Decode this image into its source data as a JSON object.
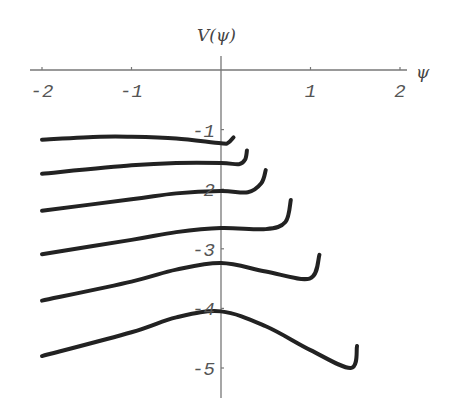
{
  "chart_data": {
    "type": "line",
    "title": "",
    "xlabel": "ψ",
    "ylabel": "V(ψ)",
    "xlim": [
      -2.05,
      2.1
    ],
    "ylim": [
      -5.5,
      0.25
    ],
    "grid": false,
    "legend": null,
    "x_ticks": [
      {
        "value": -2,
        "label": "-2"
      },
      {
        "value": -1,
        "label": "-1"
      },
      {
        "value": 1,
        "label": "1"
      },
      {
        "value": 2,
        "label": "2"
      }
    ],
    "y_ticks": [
      {
        "value": -1,
        "label": "-1"
      },
      {
        "value": -2,
        "label": "2"
      },
      {
        "value": -3,
        "label": "-3"
      },
      {
        "value": -4,
        "label": "-4"
      },
      {
        "value": -5,
        "label": "-5"
      }
    ],
    "series": [
      {
        "name": "curve-1",
        "points": [
          [
            -2,
            -1.17
          ],
          [
            -1.35,
            -1.12
          ],
          [
            -1,
            -1.12
          ],
          [
            -0.5,
            -1.15
          ],
          [
            0,
            -1.23
          ],
          [
            0.08,
            -1.22
          ],
          [
            0.14,
            -1.13
          ]
        ]
      },
      {
        "name": "curve-2",
        "points": [
          [
            -2,
            -1.74
          ],
          [
            -1,
            -1.6
          ],
          [
            -0.5,
            -1.56
          ],
          [
            0,
            -1.56
          ],
          [
            0.2,
            -1.58
          ],
          [
            0.27,
            -1.5
          ],
          [
            0.29,
            -1.35
          ]
        ]
      },
      {
        "name": "curve-3",
        "points": [
          [
            -2,
            -2.36
          ],
          [
            -1,
            -2.17
          ],
          [
            -0.5,
            -2.07
          ],
          [
            0,
            -2.03
          ],
          [
            0.3,
            -2.05
          ],
          [
            0.45,
            -1.9
          ],
          [
            0.5,
            -1.68
          ]
        ]
      },
      {
        "name": "curve-4",
        "points": [
          [
            -2,
            -3.09
          ],
          [
            -1,
            -2.85
          ],
          [
            -0.5,
            -2.72
          ],
          [
            0,
            -2.65
          ],
          [
            0.5,
            -2.67
          ],
          [
            0.72,
            -2.55
          ],
          [
            0.78,
            -2.18
          ]
        ]
      },
      {
        "name": "curve-5",
        "points": [
          [
            -2,
            -3.87
          ],
          [
            -1,
            -3.55
          ],
          [
            -0.5,
            -3.35
          ],
          [
            0,
            -3.24
          ],
          [
            0.5,
            -3.38
          ],
          [
            0.99,
            -3.5
          ],
          [
            1.1,
            -3.1
          ]
        ]
      },
      {
        "name": "curve-6",
        "points": [
          [
            -2,
            -4.8
          ],
          [
            -1,
            -4.4
          ],
          [
            -0.5,
            -4.15
          ],
          [
            0,
            -4.05
          ],
          [
            0.5,
            -4.3
          ],
          [
            1.0,
            -4.7
          ],
          [
            1.45,
            -5.0
          ],
          [
            1.52,
            -4.63
          ]
        ]
      }
    ]
  },
  "layout": {
    "origin_px": [
      221,
      70
    ],
    "x_scale_px": 89.5,
    "y_scale_px": 59.6,
    "x_axis_px": [
      30,
      407
    ],
    "y_axis_px": [
      56,
      398
    ],
    "colors": {
      "axis": "#777777",
      "curve": "#222222",
      "text": "#555555"
    }
  }
}
